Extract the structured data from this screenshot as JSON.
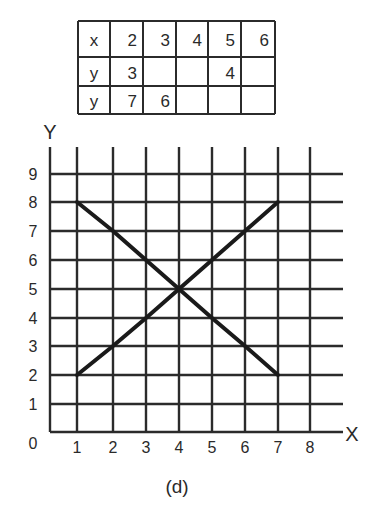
{
  "table": {
    "rows": [
      {
        "label": "x",
        "cells": [
          "2",
          "3",
          "4",
          "5",
          "6"
        ]
      },
      {
        "label": "y",
        "cells": [
          "3",
          "",
          "",
          "4",
          ""
        ]
      },
      {
        "label": "y",
        "cells": [
          "7",
          "6",
          "",
          "",
          ""
        ]
      }
    ]
  },
  "chart": {
    "x_axis_label": "X",
    "y_axis_label": "Y",
    "origin_label": "0",
    "x_ticks": [
      "1",
      "2",
      "3",
      "4",
      "5",
      "6",
      "7",
      "8"
    ],
    "y_ticks": [
      "1",
      "2",
      "3",
      "4",
      "5",
      "6",
      "7",
      "8",
      "9"
    ],
    "caption": "(d)"
  },
  "colors": {
    "grid": "#2b2b2b",
    "line": "#1a1a1a",
    "background": "#ffffff"
  },
  "chart_data": {
    "type": "line",
    "title": "",
    "caption": "(d)",
    "xlabel": "X",
    "ylabel": "Y",
    "xlim": [
      0,
      8
    ],
    "ylim": [
      0,
      9
    ],
    "grid": true,
    "x_ticks": [
      0,
      1,
      2,
      3,
      4,
      5,
      6,
      7,
      8
    ],
    "y_ticks": [
      0,
      1,
      2,
      3,
      4,
      5,
      6,
      7,
      8,
      9
    ],
    "series": [
      {
        "name": "y = x + 1",
        "x": [
          1,
          2,
          3,
          4,
          5,
          6,
          7
        ],
        "y": [
          2,
          3,
          4,
          5,
          6,
          7,
          8
        ]
      },
      {
        "name": "y = 9 - x",
        "x": [
          1,
          2,
          3,
          4,
          5,
          6,
          7
        ],
        "y": [
          8,
          7,
          6,
          5,
          4,
          3,
          2
        ]
      }
    ],
    "table": {
      "x": [
        2,
        3,
        4,
        5,
        6
      ],
      "y_row1": [
        3,
        null,
        null,
        4,
        null
      ],
      "y_row2": [
        7,
        6,
        null,
        null,
        null
      ]
    }
  }
}
